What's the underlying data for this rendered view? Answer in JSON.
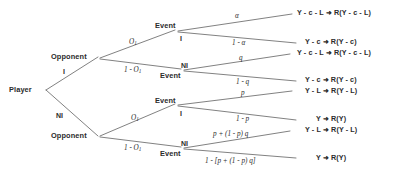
{
  "diagram": {
    "nodes": {
      "player": "Player",
      "opponent_top": "Opponent",
      "opponent_bottom": "Opponent",
      "event_1": "Event",
      "event_2": "Event",
      "event_3": "Event",
      "event_4": "Event"
    },
    "player_choices": {
      "invest": "I",
      "not_invest": "NI"
    },
    "opponent_top_probs": {
      "upper": "O",
      "upper_sub": "1",
      "lower_prefix": "1 - O",
      "lower_sub": "1"
    },
    "opponent_bottom_probs": {
      "upper": "O",
      "upper_sub": "1",
      "lower_prefix": "1 - O",
      "lower_sub": "1"
    },
    "event_choices": {
      "event_1": "I",
      "event_2": "NI",
      "event_3": "I",
      "event_4": "NI"
    },
    "branch_probs": {
      "alpha": "α",
      "one_minus_alpha": "1 - α",
      "q": "q",
      "one_minus_q": "1 - q",
      "p": "p",
      "one_minus_p": "1 - p",
      "p_plus": "p + (1 - p) q",
      "one_minus_bracket": "1 - [p + (1 - p) q]"
    },
    "outcomes": [
      "Y - c - L  ➜  R(Y - c - L)",
      "Y - c   ➜  R(Y - c)",
      "Y - c - L  ➜  R(Y - c - L)",
      "Y - c  ➜  R(Y - c)",
      "Y - L  ➜  R(Y - L)",
      "Y   ➜  R(Y)",
      "Y - L  ➜  R(Y - L)",
      "Y   ➜  R(Y)"
    ],
    "colors": {
      "ink": "#2b2b2b",
      "line": "#4a4a4a",
      "background": "#ffffff"
    }
  }
}
